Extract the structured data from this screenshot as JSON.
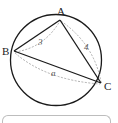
{
  "figure": {
    "type": "inscribed-triangle",
    "circle": {
      "cx": 56,
      "cy": 60,
      "r": 45.5,
      "stroke": "#1a1a1a"
    },
    "vertices": [
      {
        "id": "A",
        "label": "A",
        "x": 60,
        "y": 20,
        "label_x": 57,
        "label_y": 15
      },
      {
        "id": "B",
        "label": "B",
        "x": 14,
        "y": 51,
        "label_x": 2,
        "label_y": 55
      },
      {
        "id": "C",
        "label": "C",
        "x": 101,
        "y": 83,
        "label_x": 104,
        "label_y": 90
      }
    ],
    "sides": [
      {
        "from": "A",
        "to": "B",
        "length_label": "3",
        "label_x": 38,
        "label_y": 45
      },
      {
        "from": "A",
        "to": "C",
        "length_label": "4",
        "label_x": 84,
        "label_y": 50
      },
      {
        "from": "B",
        "to": "C",
        "length_label": "a",
        "label_x": 51,
        "label_y": 76
      }
    ],
    "colors": {
      "solid_line": "#1a1a1a",
      "dashed_line": "#9a9a9a",
      "box_border": "#bdbdbd"
    }
  },
  "labels": {
    "A": "A",
    "B": "B",
    "C": "C",
    "AB": "3",
    "AC": "4",
    "BC": "a"
  }
}
